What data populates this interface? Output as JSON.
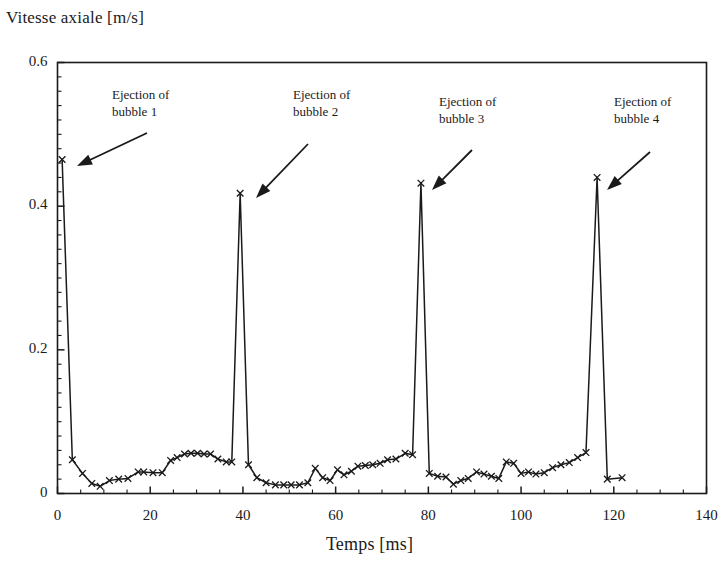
{
  "chart_data": {
    "type": "line",
    "title": "",
    "ylabel": "Vitesse axiale [m/s]",
    "xlabel": "Temps [ms]",
    "xlim": [
      0,
      140
    ],
    "ylim": [
      0,
      0.6
    ],
    "x_major_ticks": [
      0,
      20,
      40,
      60,
      80,
      100,
      120,
      140
    ],
    "x_tick_labels": [
      "0",
      "20",
      "40",
      "60",
      "80",
      "100",
      "120",
      "140"
    ],
    "x_minor_step": 5,
    "y_major_ticks": [
      0,
      0.2,
      0.4,
      0.6
    ],
    "y_tick_labels": [
      "0",
      "0.2",
      "0.4",
      "0.6"
    ],
    "y_minor_step": 0.02,
    "grid": false,
    "legend": null,
    "marker": "x",
    "line_color": "#1a1a1a",
    "series": [
      {
        "name": "Vitesse axiale",
        "points": [
          [
            1.0,
            0.465
          ],
          [
            3.2,
            0.047
          ],
          [
            5.4,
            0.028
          ],
          [
            7.4,
            0.014
          ],
          [
            9.2,
            0.01
          ],
          [
            11.2,
            0.018
          ],
          [
            13.2,
            0.02
          ],
          [
            15.2,
            0.021
          ],
          [
            17.4,
            0.03
          ],
          [
            18.6,
            0.03
          ],
          [
            20.6,
            0.029
          ],
          [
            22.6,
            0.029
          ],
          [
            24.4,
            0.046
          ],
          [
            25.8,
            0.05
          ],
          [
            27.4,
            0.055
          ],
          [
            28.8,
            0.056
          ],
          [
            30.2,
            0.056
          ],
          [
            31.6,
            0.055
          ],
          [
            33.0,
            0.055
          ],
          [
            34.6,
            0.048
          ],
          [
            36.4,
            0.044
          ],
          [
            37.6,
            0.044
          ],
          [
            39.4,
            0.418
          ],
          [
            41.2,
            0.04
          ],
          [
            43.0,
            0.022
          ],
          [
            45.0,
            0.015
          ],
          [
            47.0,
            0.012
          ],
          [
            48.8,
            0.012
          ],
          [
            50.4,
            0.012
          ],
          [
            52.2,
            0.012
          ],
          [
            54.0,
            0.015
          ],
          [
            55.6,
            0.035
          ],
          [
            57.2,
            0.022
          ],
          [
            58.8,
            0.018
          ],
          [
            60.4,
            0.033
          ],
          [
            61.8,
            0.026
          ],
          [
            63.4,
            0.031
          ],
          [
            64.8,
            0.038
          ],
          [
            66.4,
            0.039
          ],
          [
            68.0,
            0.04
          ],
          [
            69.6,
            0.042
          ],
          [
            71.2,
            0.047
          ],
          [
            73.0,
            0.048
          ],
          [
            75.0,
            0.056
          ],
          [
            76.6,
            0.054
          ],
          [
            78.4,
            0.432
          ],
          [
            80.2,
            0.028
          ],
          [
            82.0,
            0.024
          ],
          [
            83.8,
            0.023
          ],
          [
            85.4,
            0.013
          ],
          [
            87.0,
            0.018
          ],
          [
            88.6,
            0.021
          ],
          [
            90.4,
            0.03
          ],
          [
            92.0,
            0.027
          ],
          [
            93.6,
            0.024
          ],
          [
            95.2,
            0.021
          ],
          [
            96.8,
            0.044
          ],
          [
            98.4,
            0.042
          ],
          [
            100.0,
            0.028
          ],
          [
            101.6,
            0.03
          ],
          [
            103.2,
            0.027
          ],
          [
            105.0,
            0.029
          ],
          [
            106.8,
            0.036
          ],
          [
            108.6,
            0.04
          ],
          [
            110.4,
            0.043
          ],
          [
            112.2,
            0.05
          ],
          [
            114.0,
            0.057
          ],
          [
            116.4,
            0.44
          ],
          [
            118.6,
            0.02
          ],
          [
            121.8,
            0.022
          ]
        ]
      }
    ],
    "annotations": [
      {
        "id": "bubble-1",
        "line1": "Ejection of",
        "line2": "bubble 1",
        "text_x": 112,
        "text_y": 86,
        "arrow_from_x": 147,
        "arrow_from_y": 133,
        "arrow_to_x": 77,
        "arrow_to_y": 166
      },
      {
        "id": "bubble-2",
        "line1": "Ejection of",
        "line2": "bubble 2",
        "text_x": 293,
        "text_y": 86,
        "arrow_from_x": 308,
        "arrow_from_y": 144,
        "arrow_to_x": 256,
        "arrow_to_y": 198
      },
      {
        "id": "bubble-3",
        "line1": "Ejection of",
        "line2": "bubble 3",
        "text_x": 439,
        "text_y": 93,
        "arrow_from_x": 472,
        "arrow_from_y": 150,
        "arrow_to_x": 432,
        "arrow_to_y": 190
      },
      {
        "id": "bubble-4",
        "line1": "Ejection of",
        "line2": "bubble 4",
        "text_x": 614,
        "text_y": 93,
        "arrow_from_x": 650,
        "arrow_from_y": 152,
        "arrow_to_x": 607,
        "arrow_to_y": 190
      }
    ]
  },
  "axes": {
    "ylabel": "Vitesse axiale [m/s]",
    "xlabel": "Temps [ms]"
  }
}
